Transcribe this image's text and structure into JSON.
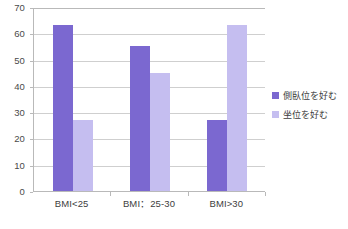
{
  "chart_data": {
    "type": "bar",
    "title": "",
    "subtitle": "",
    "xlabel": "",
    "ylabel": "",
    "categories": [
      "BMI<25",
      "BMI：25-30",
      "BMI>30"
    ],
    "series": [
      {
        "name": "側臥位を好む",
        "values": [
          63,
          55,
          27
        ],
        "color": "#7B68D0"
      },
      {
        "name": "坐位を好む",
        "values": [
          27,
          45,
          63
        ],
        "color": "#C5BEF0"
      }
    ],
    "ylim": [
      0,
      70
    ],
    "yticks": [
      0,
      10,
      20,
      30,
      40,
      50,
      60,
      70
    ],
    "ytick_labels": [
      "0",
      "10",
      "20",
      "30",
      "40",
      "50",
      "60",
      "70"
    ],
    "grid": true,
    "grid_axis": "y",
    "legend_position": "right",
    "background_color": "#ffffff",
    "grid_color": "#cfcfcf",
    "axis_color": "#b9b9b9"
  }
}
